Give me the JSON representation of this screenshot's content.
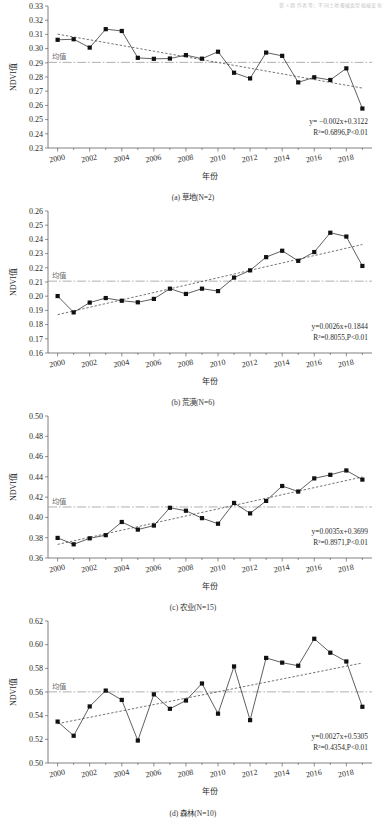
{
  "running_head": "第 3 期          作者等：不同土地覆被类型植被变化",
  "axes": {
    "xlabel": "年份",
    "ylabel": "NDVI值",
    "mean_label": "均值",
    "xticks": [
      2000,
      2002,
      2004,
      2006,
      2008,
      2010,
      2012,
      2014,
      2016,
      2018
    ],
    "xlim": [
      1999.4,
      2019.6
    ]
  },
  "chart_data": [
    {
      "id": "a",
      "type": "line",
      "title": "(a) 草地(N=2)",
      "category": "草地",
      "n": 2,
      "xlabel": "年份",
      "ylabel": "NDVI值",
      "xlim": [
        1999.4,
        2019.6
      ],
      "ylim": [
        0.23,
        0.33
      ],
      "ytick_step": 0.01,
      "yticks": [
        "0.23",
        "0.24",
        "0.25",
        "0.26",
        "0.27",
        "0.28",
        "0.29",
        "0.30",
        "0.31",
        "0.32",
        "0.33"
      ],
      "grid": false,
      "mean": 0.2903,
      "mean_label": "均值",
      "equation": "y= −0.002x+0.3122",
      "r2_text": "R²=0.6896,P<0.01",
      "slope": -0.002,
      "intercept": 0.3122,
      "r2": 0.6896,
      "p": "<0.01",
      "x": [
        2000,
        2001,
        2002,
        2003,
        2004,
        2005,
        2006,
        2007,
        2008,
        2009,
        2010,
        2011,
        2012,
        2013,
        2014,
        2015,
        2016,
        2017,
        2018,
        2019
      ],
      "values": [
        0.3062,
        0.3066,
        0.3007,
        0.3137,
        0.3124,
        0.2935,
        0.2928,
        0.293,
        0.2954,
        0.2929,
        0.2978,
        0.283,
        0.279,
        0.2972,
        0.2949,
        0.2762,
        0.2798,
        0.2779,
        0.2861,
        0.2578
      ]
    },
    {
      "id": "b",
      "type": "line",
      "title": "(b) 荒漠(N=6)",
      "category": "荒漠",
      "n": 6,
      "xlabel": "年份",
      "ylabel": "NDVI值",
      "xlim": [
        1999.4,
        2019.6
      ],
      "ylim": [
        0.16,
        0.26
      ],
      "ytick_step": 0.01,
      "yticks": [
        "0.16",
        "0.17",
        "0.18",
        "0.19",
        "0.20",
        "0.21",
        "0.22",
        "0.23",
        "0.24",
        "0.25",
        "0.26"
      ],
      "grid": false,
      "mean": 0.2106,
      "mean_label": "均值",
      "equation": "y=0.0026x+0.1844",
      "r2_text": "R²=0.8055,P<0.01",
      "slope": 0.0026,
      "intercept": 0.1844,
      "r2": 0.8055,
      "p": "<0.01",
      "x": [
        2000,
        2001,
        2002,
        2003,
        2004,
        2005,
        2006,
        2007,
        2008,
        2009,
        2010,
        2011,
        2012,
        2013,
        2014,
        2015,
        2016,
        2017,
        2018,
        2019
      ],
      "values": [
        0.2001,
        0.1886,
        0.1955,
        0.1987,
        0.1968,
        0.1957,
        0.1981,
        0.2053,
        0.2016,
        0.2053,
        0.2036,
        0.2131,
        0.2182,
        0.2275,
        0.232,
        0.2249,
        0.2311,
        0.2447,
        0.242,
        0.2213
      ]
    },
    {
      "id": "c",
      "type": "line",
      "title": "(c) 农业(N=15)",
      "category": "农业",
      "n": 15,
      "xlabel": "年份",
      "ylabel": "NDVI值",
      "xlim": [
        1999.4,
        2019.6
      ],
      "ylim": [
        0.36,
        0.5
      ],
      "ytick_step": 0.02,
      "yticks": [
        "0.36",
        "0.38",
        "0.40",
        "0.42",
        "0.44",
        "0.46",
        "0.48",
        "0.50"
      ],
      "grid": false,
      "mean": 0.4103,
      "mean_label": "均值",
      "equation": "y=0.0035x+0.3699",
      "r2_text": "R²=0.8971,P<0.01",
      "slope": 0.0035,
      "intercept": 0.3699,
      "r2": 0.8971,
      "p": "<0.01",
      "x": [
        2000,
        2001,
        2002,
        2003,
        2004,
        2005,
        2006,
        2007,
        2008,
        2009,
        2010,
        2011,
        2012,
        2013,
        2014,
        2015,
        2016,
        2017,
        2018,
        2019
      ],
      "values": [
        0.3798,
        0.3735,
        0.3794,
        0.3825,
        0.3955,
        0.388,
        0.392,
        0.4095,
        0.4066,
        0.3993,
        0.3938,
        0.4143,
        0.404,
        0.4163,
        0.431,
        0.4255,
        0.4385,
        0.442,
        0.4463,
        0.4373
      ]
    },
    {
      "id": "d",
      "type": "line",
      "title": "(d) 森林(N=10)",
      "category": "森林",
      "n": 10,
      "xlabel": "年份",
      "ylabel": "NDVI值",
      "xlim": [
        1999.4,
        2019.6
      ],
      "ylim": [
        0.5,
        0.62
      ],
      "ytick_step": 0.02,
      "yticks": [
        "0.50",
        "0.52",
        "0.54",
        "0.56",
        "0.58",
        "0.60",
        "0.62"
      ],
      "grid": false,
      "mean": 0.5601,
      "mean_label": "均值",
      "equation": "y=0.0027x+0.5305",
      "r2_text": "R²=0.4354,P<0.01",
      "slope": 0.0027,
      "intercept": 0.5305,
      "r2": 0.4354,
      "p": "<0.01",
      "x": [
        2000,
        2001,
        2002,
        2003,
        2004,
        2005,
        2006,
        2007,
        2008,
        2009,
        2010,
        2011,
        2012,
        2013,
        2014,
        2015,
        2016,
        2017,
        2018,
        2019
      ],
      "values": [
        0.535,
        0.523,
        0.5478,
        0.5612,
        0.5533,
        0.519,
        0.558,
        0.5458,
        0.5528,
        0.5672,
        0.5417,
        0.5816,
        0.5362,
        0.5888,
        0.5848,
        0.5822,
        0.605,
        0.5932,
        0.5858,
        0.5475
      ]
    }
  ]
}
